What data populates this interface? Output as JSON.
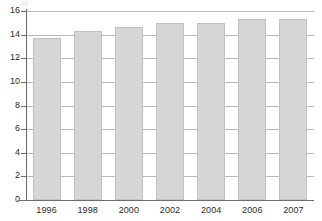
{
  "chart_data": {
    "type": "bar",
    "title": "",
    "subtitle": "",
    "xlabel": "",
    "ylabel": "",
    "categories": [
      "1996",
      "1998",
      "2000",
      "2002",
      "2004",
      "2006",
      "2007"
    ],
    "values": [
      13.75,
      14.35,
      14.65,
      15.0,
      14.95,
      15.3,
      15.3
    ],
    "series": [
      {
        "name": "",
        "values": [
          13.75,
          14.35,
          14.65,
          15.0,
          14.95,
          15.3,
          15.3
        ]
      }
    ],
    "ylim": [
      0,
      16
    ],
    "xlim": null,
    "y_ticks": [
      "0",
      "2",
      "4",
      "6",
      "8",
      "10",
      "12",
      "14",
      "16"
    ],
    "y_tick_values": [
      0,
      2,
      4,
      6,
      8,
      10,
      12,
      14,
      16
    ],
    "x_ticks": [
      "1996",
      "1998",
      "2000",
      "2002",
      "2004",
      "2006",
      "2007"
    ],
    "grid": "horizontal",
    "legend": null,
    "legend_position": "none",
    "annotations": [],
    "colors": {
      "bar_fill": "#d6d6d6",
      "bar_border": "#c2c2c2",
      "gridline": "#b9b9b9",
      "axis": "#6e6e6e",
      "tick_label": "#2b2b2b",
      "background": "#ffffff"
    }
  }
}
